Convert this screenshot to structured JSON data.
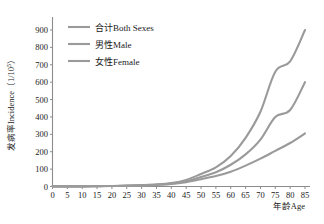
{
  "chart_data": {
    "type": "line",
    "title": "",
    "xlabel": "年龄Age",
    "ylabel": "发病率Incidence（1/10⁵）",
    "ylabel_main": "发病率Incidence（1/10",
    "ylabel_sup": "5",
    "ylabel_tail": "）",
    "xlim": [
      0,
      85
    ],
    "ylim": [
      0,
      900
    ],
    "xticks": [
      0,
      5,
      10,
      15,
      20,
      25,
      30,
      35,
      40,
      45,
      50,
      55,
      60,
      65,
      70,
      75,
      80,
      85
    ],
    "yticks": [
      0,
      100,
      200,
      300,
      400,
      500,
      600,
      700,
      800,
      900
    ],
    "grid": false,
    "legend_position": "top-left-inside",
    "x": [
      0,
      5,
      10,
      15,
      20,
      25,
      30,
      35,
      40,
      45,
      50,
      55,
      60,
      65,
      70,
      75,
      80,
      85
    ],
    "series": [
      {
        "name": "合计Both Sexes",
        "color": "#9a9a9a",
        "values": [
          1,
          1,
          1,
          2,
          3,
          5,
          8,
          12,
          20,
          38,
          72,
          110,
          175,
          280,
          430,
          660,
          720,
          900
        ]
      },
      {
        "name": "男性Male",
        "color": "#9a9a9a",
        "values": [
          1,
          1,
          1,
          2,
          3,
          4,
          6,
          10,
          16,
          30,
          55,
          82,
          125,
          185,
          270,
          400,
          440,
          600
        ]
      },
      {
        "name": "女性Female",
        "color": "#9a9a9a",
        "values": [
          1,
          1,
          1,
          2,
          3,
          4,
          6,
          9,
          14,
          25,
          42,
          60,
          85,
          120,
          160,
          205,
          250,
          305
        ]
      }
    ]
  },
  "legend": {
    "items": [
      {
        "label": "合计Both Sexes"
      },
      {
        "label": "男性Male"
      },
      {
        "label": "女性Female"
      }
    ]
  },
  "axes": {
    "x_title": "年龄Age",
    "y_title_main": "发病率Incidence（1/10",
    "y_title_sup": "5",
    "y_title_tail": "）"
  }
}
